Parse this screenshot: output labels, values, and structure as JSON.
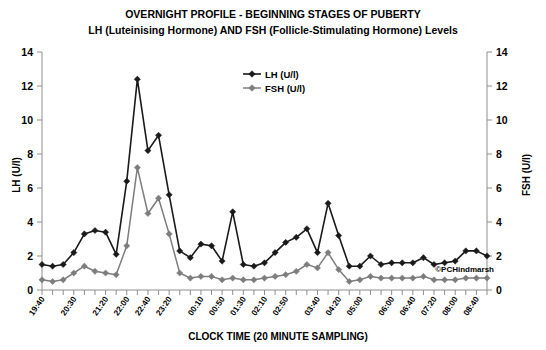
{
  "chart_data": {
    "type": "line",
    "title": "OVERNIGHT PROFILE  - BEGINNING STAGES OF PUBERTY",
    "subtitle": "LH (Luteinising Hormone) AND FSH (Follicle-Stimulating Hormone) Levels",
    "xlabel": "CLOCK TIME (20 MINUTE SAMPLING)",
    "ylabel": "LH (U/l)",
    "y2label": "FSH (U/l)",
    "ylim": [
      0,
      14
    ],
    "y2lim": [
      0,
      14
    ],
    "yticks": [
      0,
      2,
      4,
      6,
      8,
      10,
      12,
      14
    ],
    "y2ticks": [
      0,
      2,
      4,
      6,
      8,
      10,
      12,
      14
    ],
    "grid": false,
    "legend_position": "top-center",
    "credit": "©PCHindmarsh",
    "x": [
      "19:40",
      "20:00",
      "20:20",
      "20:30",
      "20:50",
      "21:10",
      "21:20",
      "21:40",
      "22:00",
      "22:20",
      "22:40",
      "23:00",
      "23:20",
      "23:40",
      "00:00",
      "00:10",
      "00:30",
      "00:50",
      "01:10",
      "01:30",
      "01:50",
      "02:10",
      "02:30",
      "02:50",
      "03:10",
      "03:30",
      "03:40",
      "04:00",
      "04:20",
      "04:40",
      "05:00",
      "05:20",
      "05:40",
      "06:00",
      "06:20",
      "06:40",
      "07:00",
      "07:20",
      "07:40",
      "08:00",
      "08:20",
      "08:40",
      "09:00"
    ],
    "xtick_labels": [
      "19:40",
      "",
      "20:30",
      "",
      "21:20",
      "",
      "22:00",
      "",
      "22:40",
      "",
      "23:20",
      "",
      "00:10",
      "",
      "00:50",
      "",
      "01:30",
      "",
      "02:10",
      "",
      "02:50",
      "",
      "03:40",
      "",
      "04:20",
      "",
      "05:00",
      "",
      "06:00",
      "",
      "06:40",
      "",
      "07:20",
      "",
      "08:00",
      "",
      "08:40",
      ""
    ],
    "xticks_shown": [
      "19:40",
      "20:30",
      "21:20",
      "22:00",
      "22:40",
      "23:20",
      "00:10",
      "00:50",
      "01:30",
      "02:10",
      "02:50",
      "03:40",
      "04:20",
      "05:00",
      "06:00",
      "06:40",
      "07:20",
      "08:00",
      "08:40"
    ],
    "series": [
      {
        "name": "LH (U/l)",
        "color": "#1a1a1a",
        "marker": "diamond",
        "values": [
          1.5,
          1.4,
          1.5,
          2.2,
          3.3,
          3.5,
          3.4,
          2.1,
          6.4,
          12.4,
          8.2,
          9.1,
          5.6,
          2.3,
          1.9,
          2.7,
          2.6,
          1.7,
          4.6,
          1.5,
          1.4,
          1.6,
          2.2,
          2.8,
          3.1,
          3.6,
          2.2,
          5.1,
          3.2,
          1.4,
          1.4,
          2.0,
          1.5,
          1.6,
          1.6,
          1.6,
          1.9,
          1.5,
          1.6,
          1.7,
          2.3,
          2.3,
          2.0
        ]
      },
      {
        "name": "FSH (U/l)",
        "color": "#7d7d7d",
        "marker": "diamond",
        "values": [
          0.6,
          0.5,
          0.6,
          1.0,
          1.4,
          1.1,
          1.0,
          0.9,
          2.6,
          7.2,
          4.5,
          5.4,
          3.3,
          1.0,
          0.7,
          0.8,
          0.8,
          0.6,
          0.7,
          0.6,
          0.6,
          0.7,
          0.8,
          0.9,
          1.1,
          1.5,
          1.3,
          2.2,
          1.2,
          0.5,
          0.6,
          0.8,
          0.7,
          0.7,
          0.7,
          0.7,
          0.8,
          0.6,
          0.6,
          0.6,
          0.7,
          0.7,
          0.7
        ]
      }
    ]
  },
  "legend": {
    "items": [
      {
        "label": "LH (U/l)"
      },
      {
        "label": "FSH (U/l)"
      }
    ]
  }
}
